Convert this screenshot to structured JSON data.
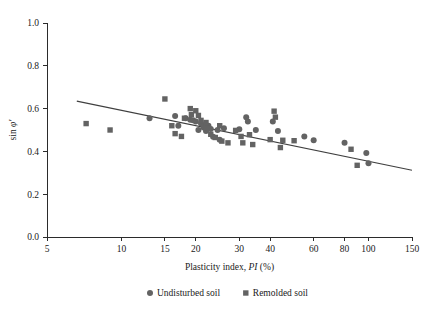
{
  "chart_data": {
    "type": "scatter",
    "title": "",
    "xlabel": "Plasticity index, PI (%)",
    "xlabel_parts": {
      "prefix": "Plasticity index, ",
      "italic": "PI",
      "suffix": " (%)"
    },
    "ylabel": "sin φ'",
    "ylabel_parts": {
      "prefix": "sin ",
      "italic": "φ′"
    },
    "xscale": "log",
    "xlim": [
      5,
      150
    ],
    "ylim": [
      0.0,
      1.0
    ],
    "xticks": [
      5,
      10,
      15,
      20,
      30,
      40,
      60,
      80,
      100,
      150
    ],
    "xtick_labels": [
      "5",
      "10",
      "15",
      "20",
      "30",
      "40",
      "60",
      "80",
      "100",
      "150"
    ],
    "yticks": [
      0.0,
      0.2,
      0.4,
      0.6,
      0.8,
      1.0
    ],
    "ytick_labels": [
      "0.0",
      "0.2",
      "0.4",
      "0.6",
      "0.8",
      "1.0"
    ],
    "grid": false,
    "legend_position": "bottom-center",
    "marker_color": "#636363",
    "line_color": "#3f3f3f",
    "series": [
      {
        "name": "Undisturbed soil",
        "marker": "circle",
        "color": "#636363",
        "points": [
          [
            13.0,
            0.555
          ],
          [
            16.5,
            0.565
          ],
          [
            17.0,
            0.52
          ],
          [
            18.2,
            0.555
          ],
          [
            19.0,
            0.548
          ],
          [
            19.5,
            0.545
          ],
          [
            20.0,
            0.54
          ],
          [
            20.5,
            0.5
          ],
          [
            21.0,
            0.53
          ],
          [
            21.5,
            0.512
          ],
          [
            22.0,
            0.495
          ],
          [
            22.5,
            0.52
          ],
          [
            23.0,
            0.505
          ],
          [
            23.5,
            0.468
          ],
          [
            24.5,
            0.5
          ],
          [
            25.0,
            0.455
          ],
          [
            26.0,
            0.508
          ],
          [
            30.0,
            0.503
          ],
          [
            32.0,
            0.56
          ],
          [
            32.5,
            0.54
          ],
          [
            35.0,
            0.5
          ],
          [
            41.0,
            0.54
          ],
          [
            43.0,
            0.495
          ],
          [
            55.0,
            0.47
          ],
          [
            60.0,
            0.452
          ],
          [
            80.0,
            0.44
          ],
          [
            98.0,
            0.392
          ],
          [
            100.0,
            0.345
          ]
        ]
      },
      {
        "name": "Remolded soil",
        "marker": "square",
        "color": "#636363",
        "points": [
          [
            7.2,
            0.53
          ],
          [
            9.0,
            0.5
          ],
          [
            15.0,
            0.645
          ],
          [
            16.0,
            0.52
          ],
          [
            16.5,
            0.483
          ],
          [
            17.5,
            0.47
          ],
          [
            18.0,
            0.555
          ],
          [
            19.0,
            0.6
          ],
          [
            19.2,
            0.572
          ],
          [
            20.0,
            0.59
          ],
          [
            20.5,
            0.568
          ],
          [
            21.0,
            0.545
          ],
          [
            21.5,
            0.52
          ],
          [
            22.0,
            0.535
          ],
          [
            22.5,
            0.508
          ],
          [
            23.0,
            0.48
          ],
          [
            24.0,
            0.465
          ],
          [
            25.0,
            0.52
          ],
          [
            25.5,
            0.448
          ],
          [
            27.0,
            0.44
          ],
          [
            29.0,
            0.498
          ],
          [
            30.5,
            0.47
          ],
          [
            31.0,
            0.44
          ],
          [
            33.0,
            0.478
          ],
          [
            34.0,
            0.432
          ],
          [
            40.0,
            0.455
          ],
          [
            41.5,
            0.588
          ],
          [
            42.0,
            0.56
          ],
          [
            44.0,
            0.418
          ],
          [
            45.0,
            0.452
          ],
          [
            50.0,
            0.45
          ],
          [
            85.0,
            0.41
          ],
          [
            90.0,
            0.335
          ]
        ]
      }
    ],
    "trendline": {
      "description": "decreasing log-linear fit",
      "x_start": 6.6,
      "y_start": 0.635,
      "x_end": 150.0,
      "y_end": 0.312
    }
  },
  "legend": {
    "items": [
      {
        "label": "Undisturbed soil",
        "marker": "circle"
      },
      {
        "label": "Remolded soil",
        "marker": "square"
      }
    ]
  }
}
